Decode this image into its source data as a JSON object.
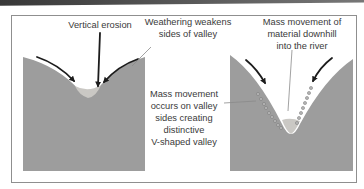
{
  "diagram": {
    "colors": {
      "land": "#9d9d9d",
      "river": "#cac8c4",
      "border": "#8f8f8f",
      "arrow": "#1c1c1c",
      "text": "#3a3a3a",
      "page_edge_dark": "#383838",
      "page_edge_light": "#777777"
    },
    "labels": {
      "vertical_erosion": "Vertical erosion",
      "weathering": {
        "line1": "Weathering weakens",
        "line2": "sides of valley"
      },
      "mass_downhill": {
        "line1": "Mass movement of",
        "line2": "material downhill",
        "line3": "into the river"
      },
      "mass_valley": {
        "line1": "Mass movement",
        "line2": "occurs on valley",
        "line3": "sides creating",
        "line4": "distinctive",
        "line5": "V-shaped valley"
      }
    },
    "debris_dots": {
      "left_slope": [
        [
          258,
          94
        ],
        [
          261,
          99
        ],
        [
          264,
          104
        ],
        [
          266,
          108
        ],
        [
          269,
          113
        ],
        [
          272,
          117
        ],
        [
          275,
          121
        ],
        [
          278,
          125
        ],
        [
          281,
          128
        ]
      ],
      "right_slope": [
        [
          311,
          88
        ],
        [
          309,
          93
        ],
        [
          307,
          98
        ],
        [
          305,
          103
        ],
        [
          303,
          108
        ],
        [
          301,
          113
        ],
        [
          299,
          118
        ],
        [
          297,
          123
        ]
      ]
    }
  }
}
